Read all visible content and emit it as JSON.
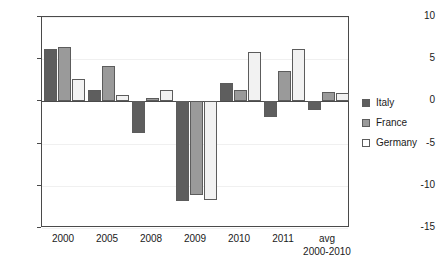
{
  "chart_data": {
    "type": "bar",
    "title": "",
    "subtitle": "",
    "xlabel": "",
    "ylabel": "",
    "ylim": [
      -15,
      10
    ],
    "yticks": [
      10,
      5,
      0,
      -5,
      -10,
      -15
    ],
    "ytick_labels": [
      "10",
      "5",
      "0",
      "-5",
      "-10",
      "-15"
    ],
    "grid": true,
    "grid_axis": "y",
    "legend_position": "right",
    "categories": [
      "2000",
      "2005",
      "2008",
      "2009",
      "2010",
      "2011",
      "avg"
    ],
    "category_sublabels": [
      "",
      "",
      "",
      "",
      "",
      "",
      "2000-2010"
    ],
    "series": [
      {
        "name": "Italy",
        "color": "#5e5e5e",
        "values": [
          6.2,
          1.3,
          -3.7,
          -11.8,
          2.2,
          -1.8,
          -1.0
        ]
      },
      {
        "name": "France",
        "color": "#9a9a9a",
        "values": [
          6.4,
          4.2,
          0.4,
          -11.1,
          1.3,
          3.6,
          1.1
        ]
      },
      {
        "name": "Germany",
        "color": "#f2f2f2",
        "values": [
          2.6,
          0.8,
          1.3,
          -11.7,
          5.9,
          6.2,
          1.0
        ]
      }
    ]
  },
  "legend": {
    "items": [
      {
        "label": "Italy"
      },
      {
        "label": "France"
      },
      {
        "label": "Germany"
      }
    ]
  },
  "colors": {
    "series_italy": "#5e5e5e",
    "series_france": "#9a9a9a",
    "series_germany": "#f2f2f2",
    "axis": "#4a4a4a",
    "grid": "#f0f0f0",
    "background": "#ffffff"
  }
}
